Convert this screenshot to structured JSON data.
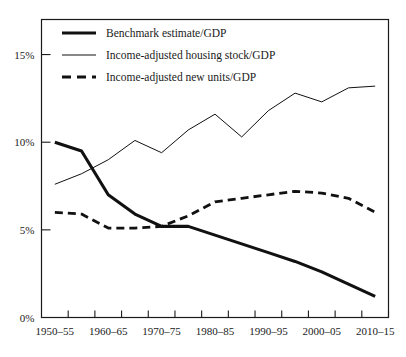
{
  "chart_data": {
    "type": "line",
    "title": "",
    "xlabel": "",
    "ylabel": "",
    "ylim": [
      0,
      17
    ],
    "y_ticks": [
      0,
      5,
      10,
      15
    ],
    "y_tick_labels": [
      "0%",
      "5%",
      "10%",
      "15%"
    ],
    "grid": false,
    "legend_position": "top-left",
    "x_tick_count": 14,
    "x_tick_labels": [
      "1950–55",
      "1960–65",
      "1970–75",
      "1980–85",
      "1990–95",
      "2000–05",
      "2010–15"
    ],
    "x_tick_label_indices": [
      0,
      2,
      4,
      6,
      8,
      10,
      12
    ],
    "x": [
      "1950–55",
      "1955–60",
      "1960–65",
      "1965–70",
      "1970–75",
      "1975–80",
      "1980–85",
      "1985–90",
      "1990–95",
      "1995–00",
      "2000–05",
      "2005–10",
      "2010–15"
    ],
    "series": [
      {
        "name": "Benchmark estimate/GDP",
        "style": "thick-solid",
        "values": [
          10.0,
          9.5,
          7.0,
          5.9,
          5.2,
          5.2,
          4.7,
          4.2,
          3.7,
          3.2,
          2.6,
          1.9,
          1.2
        ]
      },
      {
        "name": "Income-adjusted housing stock/GDP",
        "style": "thin-solid",
        "values": [
          7.6,
          8.2,
          9.0,
          10.1,
          9.4,
          10.7,
          11.6,
          10.3,
          11.8,
          12.8,
          12.3,
          13.1,
          13.2
        ]
      },
      {
        "name": "Income-adjusted new units/GDP",
        "style": "thick-dashed",
        "values": [
          6.0,
          5.9,
          5.1,
          5.1,
          5.2,
          5.8,
          6.6,
          6.8,
          7.0,
          7.2,
          7.1,
          6.8,
          6.0
        ]
      }
    ]
  },
  "legend": {
    "items": [
      {
        "label": "Benchmark estimate/GDP"
      },
      {
        "label": "Income-adjusted housing stock/GDP"
      },
      {
        "label": "Income-adjusted new units/GDP"
      }
    ]
  }
}
